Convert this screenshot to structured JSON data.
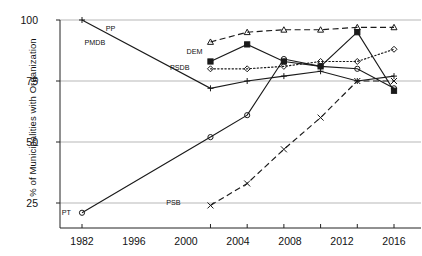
{
  "chart_data": {
    "type": "line",
    "title": "",
    "xlabel": "",
    "ylabel": "% of Municipalities with Organization",
    "x": [
      1982,
      1996,
      2000,
      2004,
      2008,
      2012,
      2016
    ],
    "xtick_labels": [
      "1982",
      "1996",
      "2000",
      "2004",
      "2008",
      "2012",
      "2016"
    ],
    "ytick_labels": [
      "25",
      "50",
      "75",
      "100"
    ],
    "yticks": [
      25,
      50,
      75,
      100
    ],
    "ylim": [
      20,
      100
    ],
    "xlim": [
      1978,
      2020
    ],
    "grid": "horizontal",
    "legend": "inline-labels",
    "series": [
      {
        "name": "PP",
        "label": "PP",
        "marker": "plus",
        "line": "solid",
        "color": "#1a1a1a",
        "x": [
          1982,
          1996,
          2000,
          2004,
          2008,
          2012,
          2016
        ],
        "values": [
          100,
          72,
          75,
          77,
          79,
          75,
          77
        ]
      },
      {
        "name": "PMDB",
        "label": "PMDB",
        "marker": "triangle",
        "line": "dashed",
        "color": "#1a1a1a",
        "x": [
          1996,
          2000,
          2004,
          2008,
          2012,
          2016
        ],
        "values": [
          91,
          95,
          96,
          96,
          97,
          97
        ]
      },
      {
        "name": "DEM",
        "label": "DEM",
        "marker": "square",
        "line": "solid",
        "color": "#1a1a1a",
        "x": [
          1996,
          2000,
          2004,
          2008,
          2012,
          2016
        ],
        "values": [
          83,
          90,
          83,
          81,
          95,
          71
        ]
      },
      {
        "name": "PSDB",
        "label": "PSDB",
        "marker": "diamond",
        "line": "dotted",
        "color": "#1a1a1a",
        "x": [
          1996,
          2000,
          2004,
          2008,
          2012,
          2016
        ],
        "values": [
          80,
          80,
          81,
          83,
          83,
          88
        ]
      },
      {
        "name": "PSB",
        "label": "PSB",
        "marker": "x",
        "line": "dashed",
        "color": "#1a1a1a",
        "x": [
          1996,
          2000,
          2004,
          2008,
          2012,
          2016
        ],
        "values": [
          24,
          33,
          47,
          60,
          75,
          75
        ]
      },
      {
        "name": "PT",
        "label": "PT",
        "marker": "circle",
        "line": "solid",
        "color": "#1a1a1a",
        "x": [
          1982,
          1996,
          2000,
          2004,
          2008,
          2012,
          2016
        ],
        "values": [
          21,
          52,
          61,
          84,
          81,
          80,
          72
        ]
      }
    ],
    "inline_labels": [
      {
        "text": "PP",
        "x": 1984.8,
        "y": 96.5
      },
      {
        "text": "PMDB",
        "x": 1982.5,
        "y": 90.5
      },
      {
        "text": "DEM",
        "x": 1993.6,
        "y": 87.0
      },
      {
        "text": "PSDB",
        "x": 1991.8,
        "y": 80.2
      },
      {
        "text": "PSB",
        "x": 1991.4,
        "y": 25.0
      },
      {
        "text": "PT",
        "x": 1980.0,
        "y": 21.0
      }
    ]
  }
}
